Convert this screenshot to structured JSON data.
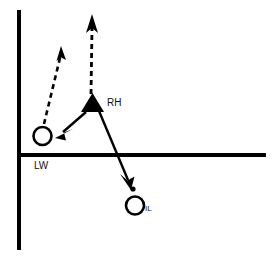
{
  "figure": {
    "title": "",
    "background_color": "#ffffff",
    "stroke_color": "#000000",
    "width": 273,
    "height": 261
  },
  "axes": {
    "vertical": {
      "name": "vertical-axis-line",
      "x": 19,
      "y1": 10,
      "y2": 250,
      "thickness": 4,
      "color": "#000000"
    },
    "horizontal": {
      "name": "horizontal-axis-line",
      "y": 155,
      "x1": 19,
      "x2": 266,
      "thickness": 4,
      "color": "#000000"
    }
  },
  "nodes": [
    {
      "id": "RH",
      "label": "RH",
      "shape": "filled-triangle",
      "x": 92.5,
      "y": 103,
      "size": 23,
      "fill": "#000000",
      "label_x": 107,
      "label_y": 106,
      "label_size": 9
    },
    {
      "id": "LW",
      "label": "LW",
      "shape": "open-circle",
      "x": 42.5,
      "y": 136,
      "radius": 9.5,
      "fill": "none",
      "stroke": "#000000",
      "label_x": 34,
      "label_y": 169,
      "label_size": 9
    },
    {
      "id": "IL",
      "label": "IL",
      "shape": "open-circle",
      "x": 135,
      "y": 205.5,
      "radius": 9.5,
      "fill": "none",
      "stroke": "#000000",
      "label_x": 145,
      "label_y": 210,
      "label_size": 7
    }
  ],
  "markers": [
    {
      "id": "IL-point",
      "label": "",
      "shape": "filled-dot",
      "x": 133,
      "y": 189,
      "radius": 2.6,
      "fill": "#000000"
    }
  ],
  "arrows": [
    {
      "id": "LW-dashed-up",
      "style": "dashed",
      "from_node": "LW",
      "to_node": "",
      "x1": 44,
      "y1": 124,
      "x2": 61,
      "y2": 52,
      "color": "#000000",
      "width": 2.6,
      "dash": "5,4"
    },
    {
      "id": "RH-dashed-up",
      "style": "dashed",
      "from_node": "RH",
      "to_node": "",
      "x1": 91,
      "y1": 94,
      "x2": 92,
      "y2": 20,
      "color": "#000000",
      "width": 2.8,
      "dash": "5,4"
    },
    {
      "id": "RH-to-LW-solid",
      "style": "solid",
      "from_node": "RH",
      "to_node": "LW",
      "x1": 86,
      "y1": 112,
      "x2": 57,
      "y2": 136,
      "color": "#000000",
      "width": 2.4,
      "dash": ""
    },
    {
      "id": "RH-to-IL-solid",
      "style": "solid",
      "from_node": "RH",
      "to_node": "IL",
      "x1": 99,
      "y1": 111,
      "x2": 131,
      "y2": 187,
      "color": "#000000",
      "width": 2.4,
      "dash": ""
    }
  ]
}
